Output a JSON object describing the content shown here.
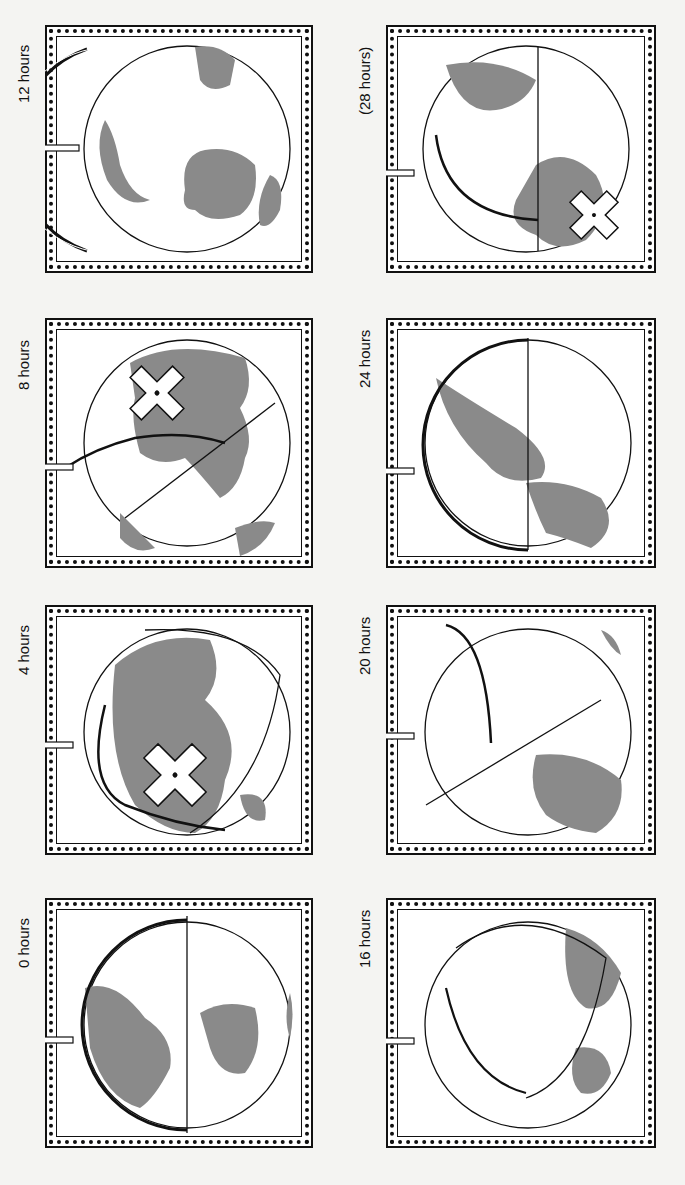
{
  "figure": {
    "panels": [
      {
        "id": "p12",
        "label": "12 hours",
        "col": 0,
        "row": 0
      },
      {
        "id": "p8",
        "label": "8 hours",
        "col": 0,
        "row": 1
      },
      {
        "id": "p4",
        "label": "4 hours",
        "col": 0,
        "row": 2
      },
      {
        "id": "p0",
        "label": "0 hours",
        "col": 0,
        "row": 3
      },
      {
        "id": "p28",
        "label": "(28 hours)",
        "col": 1,
        "row": 0
      },
      {
        "id": "p24",
        "label": "24  hours",
        "col": 1,
        "row": 1
      },
      {
        "id": "p20",
        "label": "20 hours",
        "col": 1,
        "row": 2
      },
      {
        "id": "p16",
        "label": "16 hours",
        "col": 1,
        "row": 3
      }
    ],
    "compass_letters": [
      "N",
      "E",
      "S",
      "W"
    ],
    "colors": {
      "land": "#8a8a8a",
      "ink": "#111111",
      "paper": "#ffffff"
    }
  }
}
